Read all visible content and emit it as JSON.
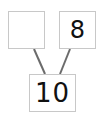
{
  "diagram": {
    "type": "number-bond",
    "whole": {
      "value": "10"
    },
    "parts": [
      {
        "value": ""
      },
      {
        "value": "8"
      }
    ],
    "colors": {
      "border": "#c8c8c8",
      "line": "#6b6b6b",
      "text": "#111111"
    }
  }
}
